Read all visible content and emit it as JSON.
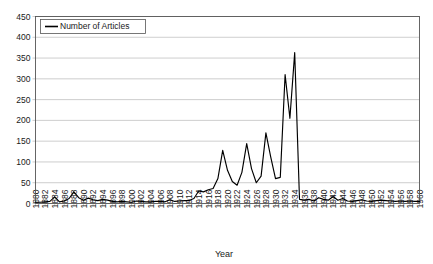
{
  "chart_data": {
    "type": "line",
    "title": "",
    "xlabel": "Year",
    "ylabel": "",
    "legend": [
      "Number of Articles"
    ],
    "legend_position": "top-left-inside",
    "grid": true,
    "xlim": [
      1880,
      1960
    ],
    "ylim": [
      0,
      450
    ],
    "ytick_step": 50,
    "xtick_step": 2,
    "yticks": [
      0,
      50,
      100,
      150,
      200,
      250,
      300,
      350,
      400,
      450
    ],
    "xticks": [
      "1880",
      "1882",
      "1884",
      "1886",
      "1888",
      "1890",
      "1892",
      "1894",
      "1896",
      "1898",
      "1900",
      "1902",
      "1904",
      "1906",
      "1908",
      "1910",
      "1912",
      "1914",
      "1916",
      "1918",
      "1920",
      "1922",
      "1924",
      "1926",
      "1928",
      "1930",
      "1932",
      "1934",
      "1936",
      "1938",
      "1940",
      "1942",
      "1944",
      "1946",
      "1948",
      "1950",
      "1952",
      "1954",
      "1956",
      "1958",
      "1960"
    ],
    "series": [
      {
        "name": "Number of Articles",
        "color": "#000000",
        "x": [
          1880,
          1881,
          1882,
          1883,
          1884,
          1885,
          1886,
          1887,
          1888,
          1889,
          1890,
          1891,
          1892,
          1893,
          1894,
          1895,
          1896,
          1897,
          1898,
          1899,
          1900,
          1901,
          1902,
          1903,
          1904,
          1905,
          1906,
          1907,
          1908,
          1909,
          1910,
          1911,
          1912,
          1913,
          1914,
          1915,
          1916,
          1917,
          1918,
          1919,
          1920,
          1921,
          1922,
          1923,
          1924,
          1925,
          1926,
          1927,
          1928,
          1929,
          1930,
          1931,
          1932,
          1933,
          1934,
          1935,
          1936,
          1937,
          1938,
          1939,
          1940,
          1941,
          1942,
          1943,
          1944,
          1945,
          1946,
          1947,
          1948,
          1949,
          1950,
          1951,
          1952,
          1953,
          1954,
          1955,
          1956,
          1957,
          1958,
          1959,
          1960
        ],
        "values": [
          3,
          3,
          4,
          5,
          16,
          4,
          6,
          12,
          28,
          14,
          8,
          13,
          9,
          7,
          10,
          8,
          5,
          4,
          5,
          4,
          3,
          6,
          5,
          4,
          4,
          5,
          5,
          4,
          9,
          5,
          6,
          7,
          7,
          12,
          30,
          28,
          33,
          36,
          60,
          128,
          80,
          53,
          44,
          75,
          144,
          84,
          50,
          66,
          170,
          112,
          60,
          63,
          310,
          205,
          363,
          10,
          8,
          10,
          6,
          14,
          10,
          8,
          17,
          8,
          12,
          6,
          5,
          7,
          9,
          6,
          5,
          7,
          8,
          7,
          6,
          5,
          6,
          5,
          6,
          5,
          5
        ]
      }
    ]
  }
}
